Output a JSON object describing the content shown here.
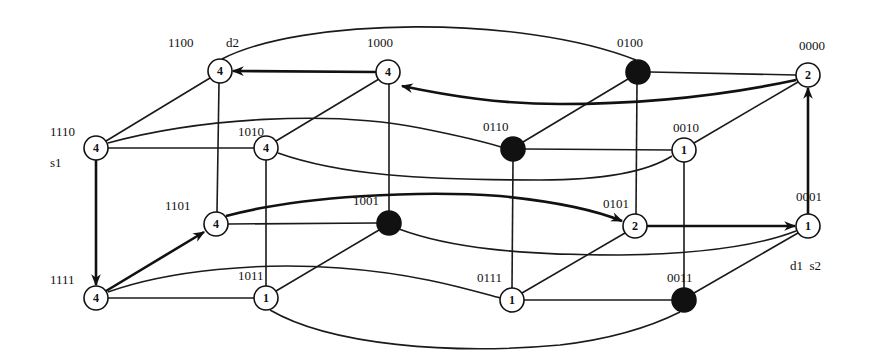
{
  "diagram": {
    "type": "4-dimensional hypercube routing diagram",
    "nodes": [
      {
        "id": "1100",
        "label": "1100",
        "value": "4",
        "filled": false,
        "x": 220,
        "y": 71,
        "lx": 168,
        "ly": 47,
        "tag": "d2",
        "tx": 226,
        "ty": 47
      },
      {
        "id": "1000",
        "label": "1000",
        "value": "4",
        "filled": false,
        "x": 388,
        "y": 72,
        "lx": 367,
        "ly": 47
      },
      {
        "id": "0100",
        "label": "0100",
        "value": "",
        "filled": true,
        "x": 638,
        "y": 72,
        "lx": 617,
        "ly": 47
      },
      {
        "id": "0000",
        "label": "0000",
        "value": "2",
        "filled": false,
        "x": 808,
        "y": 75,
        "lx": 799,
        "ly": 50
      },
      {
        "id": "1110",
        "label": "1110",
        "value": "4",
        "filled": false,
        "x": 96,
        "y": 148,
        "lx": 50,
        "ly": 136,
        "tag": "s1",
        "tx": 50,
        "ty": 167
      },
      {
        "id": "1010",
        "label": "1010",
        "value": "4",
        "filled": false,
        "x": 266,
        "y": 148,
        "lx": 238,
        "ly": 136
      },
      {
        "id": "0110",
        "label": "0110",
        "value": "",
        "filled": true,
        "x": 513,
        "y": 149,
        "lx": 483,
        "ly": 131
      },
      {
        "id": "0010",
        "label": "0010",
        "value": "1",
        "filled": false,
        "x": 684,
        "y": 150,
        "lx": 673,
        "ly": 132
      },
      {
        "id": "1101",
        "label": "1101",
        "value": "4",
        "filled": false,
        "x": 216,
        "y": 224,
        "lx": 165,
        "ly": 210
      },
      {
        "id": "1001",
        "label": "1001",
        "value": "",
        "filled": true,
        "x": 389,
        "y": 223,
        "lx": 353,
        "ly": 205
      },
      {
        "id": "0101",
        "label": "0101",
        "value": "2",
        "filled": false,
        "x": 635,
        "y": 226,
        "lx": 603,
        "ly": 208
      },
      {
        "id": "0001",
        "label": "0001",
        "value": "1",
        "filled": false,
        "x": 808,
        "y": 226,
        "lx": 796,
        "ly": 201
      },
      {
        "id": "1111",
        "label": "1111",
        "value": "4",
        "filled": false,
        "x": 96,
        "y": 298,
        "lx": 50,
        "ly": 284
      },
      {
        "id": "1011",
        "label": "1011",
        "value": "1",
        "filled": false,
        "x": 266,
        "y": 298,
        "lx": 238,
        "ly": 280
      },
      {
        "id": "0111",
        "label": "0111",
        "value": "1",
        "filled": false,
        "x": 512,
        "y": 300,
        "lx": 477,
        "ly": 282
      },
      {
        "id": "0011",
        "label": "0011",
        "value": "",
        "filled": true,
        "x": 684,
        "y": 300,
        "lx": 667,
        "ly": 282,
        "tag": "d1  s2",
        "tx": 790,
        "ty": 270
      }
    ],
    "annotations": {
      "s1": "s1",
      "s2": "s2",
      "d1": "d1",
      "d2": "d2"
    },
    "edges": [
      {
        "from": "1100",
        "to": "1000",
        "routed": true
      },
      {
        "from": "1100",
        "to": "1110"
      },
      {
        "from": "1100",
        "to": "1101"
      },
      {
        "from": "1100",
        "to": "0100",
        "curve": "top-arc"
      },
      {
        "from": "1000",
        "to": "1010"
      },
      {
        "from": "1000",
        "to": "1001"
      },
      {
        "from": "1000",
        "to": "0000",
        "routed": true,
        "curve": "back-arc"
      },
      {
        "from": "0100",
        "to": "0000"
      },
      {
        "from": "0100",
        "to": "0110"
      },
      {
        "from": "0100",
        "to": "0101"
      },
      {
        "from": "0000",
        "to": "0010"
      },
      {
        "from": "0000",
        "to": "0001",
        "routed": true
      },
      {
        "from": "1110",
        "to": "1010"
      },
      {
        "from": "1110",
        "to": "0110",
        "curve": "s-curve"
      },
      {
        "from": "1110",
        "to": "1111",
        "routed": true
      },
      {
        "from": "1010",
        "to": "1011"
      },
      {
        "from": "1010",
        "to": "0010",
        "curve": "s-curve"
      },
      {
        "from": "0110",
        "to": "0010"
      },
      {
        "from": "0110",
        "to": "0111"
      },
      {
        "from": "0010",
        "to": "0011"
      },
      {
        "from": "1101",
        "to": "1001"
      },
      {
        "from": "1101",
        "to": "1111",
        "routed": true
      },
      {
        "from": "1101",
        "to": "0101",
        "routed": true,
        "curve": "s-curve"
      },
      {
        "from": "1001",
        "to": "1011"
      },
      {
        "from": "1001",
        "to": "0001",
        "curve": "s-curve"
      },
      {
        "from": "0101",
        "to": "0001",
        "routed": true
      },
      {
        "from": "0101",
        "to": "0111"
      },
      {
        "from": "0001",
        "to": "0011"
      },
      {
        "from": "1111",
        "to": "1011"
      },
      {
        "from": "1111",
        "to": "0111",
        "curve": "s-curve"
      },
      {
        "from": "1011",
        "to": "0011",
        "curve": "bottom-arc"
      },
      {
        "from": "0111",
        "to": "0011"
      }
    ]
  }
}
